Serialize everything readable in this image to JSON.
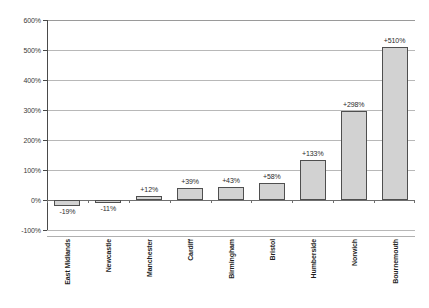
{
  "chart_data": {
    "type": "bar",
    "title": "",
    "subtitle": "",
    "xlabel": "",
    "ylabel": "",
    "ylim": [
      -100,
      600
    ],
    "ytick_step": 100,
    "yticks": [
      "-100%",
      "0%",
      "100%",
      "200%",
      "300%",
      "400%",
      "500%",
      "600%"
    ],
    "ytick_values": [
      -100,
      0,
      100,
      200,
      300,
      400,
      500,
      600
    ],
    "grid": true,
    "grid_axis": "y",
    "legend": false,
    "legend_position": "none",
    "categories": [
      "East Midlands",
      "Newcastle",
      "Manchester",
      "Cardiff",
      "Birmingham",
      "Bristol",
      "Humberside",
      "Norwich",
      "Bournemouth"
    ],
    "values": [
      -19,
      -11,
      12,
      39,
      43,
      58,
      133,
      298,
      510
    ],
    "data_labels": [
      "-19%",
      "-11%",
      "+12%",
      "+39%",
      "+43%",
      "+58%",
      "+133%",
      "+298%",
      "+510%"
    ],
    "bar_fill_color": "#d2d2d2",
    "bar_border_color": "#4f4f4f",
    "gridline_color": "#b8b8b8",
    "axis_color": "#4a4a4a",
    "background_color": "#ffffff"
  }
}
